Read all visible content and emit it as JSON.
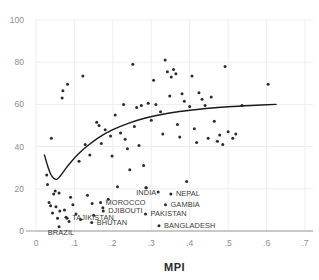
{
  "figure": {
    "clipped_top_text": "",
    "background_color": "#ffffff",
    "point_color": "#2b2b2b",
    "curve_color": "#1a1a1a",
    "grid_color": "#eeeeee",
    "axis_color": "#9a9a9a",
    "tick_text_color": "#8d8d8d",
    "annotation_color": "#3a3a3a"
  },
  "chart_data": {
    "type": "scatter",
    "title": "",
    "xlabel": "MPI",
    "ylabel": "",
    "xlim": [
      -0.02,
      0.72
    ],
    "ylim": [
      0,
      100
    ],
    "grid": true,
    "legend": "none",
    "xticks": [
      0,
      0.1,
      0.2,
      0.3,
      0.4,
      0.5,
      0.6,
      0.7
    ],
    "xticklabels": [
      "0",
      ".1",
      ".2",
      ".3",
      ".4",
      ".5",
      ".6",
      ".7"
    ],
    "yticks": [
      0,
      20,
      40,
      60,
      80,
      100
    ],
    "yticklabels": [
      "0",
      "20",
      "40",
      "60",
      "80",
      "100"
    ],
    "points": [
      {
        "x": 0.028,
        "y": 26.5
      },
      {
        "x": 0.03,
        "y": 22.0
      },
      {
        "x": 0.034,
        "y": 13.5
      },
      {
        "x": 0.038,
        "y": 12.0
      },
      {
        "x": 0.04,
        "y": 44.0
      },
      {
        "x": 0.043,
        "y": 8.5
      },
      {
        "x": 0.046,
        "y": 17.5
      },
      {
        "x": 0.05,
        "y": 19.0
      },
      {
        "x": 0.052,
        "y": 11.5
      },
      {
        "x": 0.056,
        "y": 6.0
      },
      {
        "x": 0.06,
        "y": 18.0
      },
      {
        "x": 0.062,
        "y": 9.5
      },
      {
        "x": 0.068,
        "y": 63.0
      },
      {
        "x": 0.07,
        "y": 66.5
      },
      {
        "x": 0.074,
        "y": 10.0
      },
      {
        "x": 0.078,
        "y": 6.5
      },
      {
        "x": 0.082,
        "y": 69.5
      },
      {
        "x": 0.086,
        "y": 4.5
      },
      {
        "x": 0.09,
        "y": 16.0
      },
      {
        "x": 0.096,
        "y": 12.5
      },
      {
        "x": 0.104,
        "y": 8.0
      },
      {
        "x": 0.112,
        "y": 33.0
      },
      {
        "x": 0.116,
        "y": 5.5
      },
      {
        "x": 0.122,
        "y": 73.5
      },
      {
        "x": 0.128,
        "y": 41.0
      },
      {
        "x": 0.134,
        "y": 17.0
      },
      {
        "x": 0.14,
        "y": 36.0
      },
      {
        "x": 0.146,
        "y": 13.0
      },
      {
        "x": 0.15,
        "y": 7.5
      },
      {
        "x": 0.158,
        "y": 51.5
      },
      {
        "x": 0.164,
        "y": 50.0
      },
      {
        "x": 0.17,
        "y": 41.5
      },
      {
        "x": 0.174,
        "y": 11.0
      },
      {
        "x": 0.18,
        "y": 48.0
      },
      {
        "x": 0.188,
        "y": 15.0
      },
      {
        "x": 0.194,
        "y": 45.0
      },
      {
        "x": 0.198,
        "y": 35.5
      },
      {
        "x": 0.206,
        "y": 55.0
      },
      {
        "x": 0.212,
        "y": 21.0
      },
      {
        "x": 0.22,
        "y": 46.5
      },
      {
        "x": 0.228,
        "y": 60.0
      },
      {
        "x": 0.232,
        "y": 43.5
      },
      {
        "x": 0.238,
        "y": 39.0
      },
      {
        "x": 0.244,
        "y": 29.0
      },
      {
        "x": 0.252,
        "y": 79.0
      },
      {
        "x": 0.256,
        "y": 49.5
      },
      {
        "x": 0.262,
        "y": 58.5
      },
      {
        "x": 0.268,
        "y": 40.5
      },
      {
        "x": 0.274,
        "y": 59.5
      },
      {
        "x": 0.28,
        "y": 31.0
      },
      {
        "x": 0.286,
        "y": 20.5
      },
      {
        "x": 0.292,
        "y": 60.5
      },
      {
        "x": 0.3,
        "y": 52.5
      },
      {
        "x": 0.306,
        "y": 71.5
      },
      {
        "x": 0.312,
        "y": 60.0
      },
      {
        "x": 0.318,
        "y": 18.5
      },
      {
        "x": 0.324,
        "y": 56.5
      },
      {
        "x": 0.33,
        "y": 46.0
      },
      {
        "x": 0.336,
        "y": 81.0
      },
      {
        "x": 0.342,
        "y": 75.5
      },
      {
        "x": 0.348,
        "y": 64.0
      },
      {
        "x": 0.352,
        "y": 73.0
      },
      {
        "x": 0.358,
        "y": 76.5
      },
      {
        "x": 0.364,
        "y": 74.5
      },
      {
        "x": 0.368,
        "y": 50.5
      },
      {
        "x": 0.374,
        "y": 44.5
      },
      {
        "x": 0.38,
        "y": 65.0
      },
      {
        "x": 0.386,
        "y": 61.5
      },
      {
        "x": 0.392,
        "y": 23.5
      },
      {
        "x": 0.4,
        "y": 59.0
      },
      {
        "x": 0.406,
        "y": 73.5
      },
      {
        "x": 0.412,
        "y": 48.5
      },
      {
        "x": 0.418,
        "y": 42.0
      },
      {
        "x": 0.424,
        "y": 65.5
      },
      {
        "x": 0.432,
        "y": 62.5
      },
      {
        "x": 0.44,
        "y": 59.5
      },
      {
        "x": 0.448,
        "y": 44.0
      },
      {
        "x": 0.456,
        "y": 63.5
      },
      {
        "x": 0.464,
        "y": 52.0
      },
      {
        "x": 0.472,
        "y": 42.5
      },
      {
        "x": 0.478,
        "y": 45.5
      },
      {
        "x": 0.486,
        "y": 41.0
      },
      {
        "x": 0.492,
        "y": 78.0
      },
      {
        "x": 0.5,
        "y": 47.0
      },
      {
        "x": 0.512,
        "y": 44.0
      },
      {
        "x": 0.52,
        "y": 46.0
      },
      {
        "x": 0.536,
        "y": 59.5
      },
      {
        "x": 0.604,
        "y": 69.5
      }
    ],
    "fit_curve": {
      "label": "lowess fit",
      "points": [
        {
          "x": 0.022,
          "y": 36.0
        },
        {
          "x": 0.03,
          "y": 31.0
        },
        {
          "x": 0.038,
          "y": 27.0
        },
        {
          "x": 0.046,
          "y": 25.0
        },
        {
          "x": 0.054,
          "y": 24.5
        },
        {
          "x": 0.062,
          "y": 25.8
        },
        {
          "x": 0.075,
          "y": 29.0
        },
        {
          "x": 0.09,
          "y": 32.5
        },
        {
          "x": 0.11,
          "y": 36.5
        },
        {
          "x": 0.135,
          "y": 40.5
        },
        {
          "x": 0.165,
          "y": 44.5
        },
        {
          "x": 0.2,
          "y": 48.0
        },
        {
          "x": 0.24,
          "y": 51.0
        },
        {
          "x": 0.28,
          "y": 53.3
        },
        {
          "x": 0.32,
          "y": 55.0
        },
        {
          "x": 0.36,
          "y": 56.3
        },
        {
          "x": 0.4,
          "y": 57.2
        },
        {
          "x": 0.45,
          "y": 58.2
        },
        {
          "x": 0.5,
          "y": 58.9
        },
        {
          "x": 0.56,
          "y": 59.5
        },
        {
          "x": 0.625,
          "y": 60.0
        }
      ]
    },
    "annotations": [
      {
        "label": "INDIA",
        "x": 0.287,
        "y": 20.5,
        "text_dx": 0,
        "text_dy": 7,
        "anchor": "middle",
        "marker": true
      },
      {
        "label": "NEPAL",
        "x": 0.351,
        "y": 17.5,
        "text_dx": 5,
        "text_dy": 2,
        "anchor": "start",
        "marker": true
      },
      {
        "label": "GAMBIA",
        "x": 0.337,
        "y": 12.5,
        "text_dx": 5,
        "text_dy": 2,
        "anchor": "start",
        "marker": true
      },
      {
        "label": "PAKISTAN",
        "x": 0.285,
        "y": 8.0,
        "text_dx": 5,
        "text_dy": 2,
        "anchor": "start",
        "marker": true
      },
      {
        "label": "BANGLADESH",
        "x": 0.32,
        "y": 2.5,
        "text_dx": 5,
        "text_dy": 2,
        "anchor": "start",
        "marker": true
      },
      {
        "label": "MOROCCO",
        "x": 0.168,
        "y": 13.5,
        "text_dx": 5,
        "text_dy": 2,
        "anchor": "start",
        "marker": true
      },
      {
        "label": "DJIBOUTI",
        "x": 0.175,
        "y": 9.5,
        "text_dx": 5,
        "text_dy": 2,
        "anchor": "start",
        "marker": true
      },
      {
        "label": "BHUTAN",
        "x": 0.145,
        "y": 4.0,
        "text_dx": 5,
        "text_dy": 2,
        "anchor": "start",
        "marker": true
      },
      {
        "label": "TAJIKISTAN",
        "x": 0.081,
        "y": 6.0,
        "text_dx": 5,
        "text_dy": 2,
        "anchor": "start",
        "marker": true
      },
      {
        "label": "BRAZIL",
        "x": 0.06,
        "y": 2.0,
        "text_dx": 2,
        "text_dy": 8,
        "anchor": "middle",
        "marker": true
      }
    ]
  }
}
